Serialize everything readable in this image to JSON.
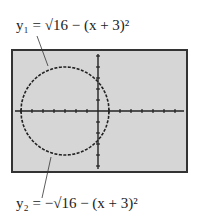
{
  "labels": {
    "y1": "y₁ = √16 − (x + 3)²",
    "y2": "y₂ = −√16 − (x + 3)²"
  },
  "chart_data": {
    "type": "line",
    "title": "",
    "xlabel": "",
    "ylabel": "",
    "grid": false,
    "legend": "none",
    "annotations": [
      {
        "text": "y1 = sqrt(16 - (x + 3)^2)",
        "points_to": "upper semicircle",
        "position": "top-left"
      },
      {
        "text": "y2 = -sqrt(16 - (x + 3)^2)",
        "points_to": "lower semicircle",
        "position": "bottom-left"
      }
    ],
    "xlim": [
      -9,
      8
    ],
    "ylim": [
      -5,
      5
    ],
    "x_tick_step": 1,
    "y_tick_step": 1,
    "series": [
      {
        "name": "y1",
        "formula": "sqrt(16-(x+3)^2)",
        "x": [
          -7,
          -6,
          -5,
          -4,
          -3,
          -2,
          -1,
          0,
          1
        ],
        "values": [
          0,
          2.65,
          3.46,
          3.87,
          4,
          3.87,
          3.46,
          2.65,
          0
        ]
      },
      {
        "name": "y2",
        "formula": "-sqrt(16-(x+3)^2)",
        "x": [
          -7,
          -6,
          -5,
          -4,
          -3,
          -2,
          -1,
          0,
          1
        ],
        "values": [
          0,
          -2.65,
          -3.46,
          -3.87,
          -4,
          -3.87,
          -3.46,
          -2.65,
          0
        ]
      }
    ],
    "style": {
      "screen_bg": "#d6d6d6",
      "frame": "#333333",
      "curve": "#222222",
      "dashed": true
    }
  }
}
